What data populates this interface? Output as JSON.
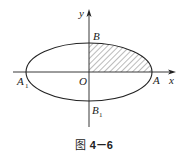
{
  "figure": {
    "caption_prefix": "图",
    "caption_number": "4－6",
    "labels": {
      "y_axis": "y",
      "x_axis": "x",
      "origin": "O",
      "top_vertex": "B",
      "bottom_vertex": "B",
      "bottom_vertex_sub": "1",
      "right_vertex": "A",
      "left_vertex": "A",
      "left_vertex_sub": "1"
    },
    "shape": "ellipse",
    "shaded_region": "first-quadrant quarter ellipse (OAB), hatched",
    "colors": {
      "stroke": "#222222",
      "hatch": "#555555",
      "background": "#ffffff"
    }
  }
}
